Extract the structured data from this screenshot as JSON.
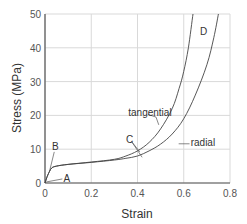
{
  "chart_data": {
    "type": "line",
    "title": "",
    "xlabel": "Strain",
    "ylabel": "Stress (MPa)",
    "xlim": [
      0,
      0.8
    ],
    "ylim": [
      0,
      50
    ],
    "xticks": [
      "0",
      "0.2",
      "0.4",
      "0.6",
      "0.8"
    ],
    "yticks": [
      "0",
      "10",
      "20",
      "30",
      "40",
      "50"
    ],
    "grid": true,
    "legend": null,
    "series": [
      {
        "name": "tangential",
        "x": [
          0,
          0.01,
          0.02,
          0.03,
          0.05,
          0.1,
          0.2,
          0.3,
          0.35,
          0.4,
          0.45,
          0.5,
          0.55,
          0.58,
          0.6,
          0.62,
          0.64
        ],
        "y": [
          0,
          2,
          3.5,
          4.5,
          5,
          5.5,
          6.2,
          7,
          8,
          9.5,
          12,
          16,
          22,
          28,
          33,
          40,
          50
        ]
      },
      {
        "name": "radial",
        "x": [
          0,
          0.01,
          0.02,
          0.03,
          0.05,
          0.1,
          0.2,
          0.3,
          0.35,
          0.4,
          0.45,
          0.5,
          0.55,
          0.6,
          0.65,
          0.7,
          0.73,
          0.75
        ],
        "y": [
          0,
          2,
          3.5,
          4.5,
          5,
          5.5,
          6.1,
          6.8,
          7.3,
          8,
          9.5,
          11.5,
          14.5,
          19,
          26,
          35,
          43,
          50
        ]
      }
    ],
    "annotations": [
      {
        "text": "A",
        "x": 0.08,
        "y": 1.5
      },
      {
        "text": "B",
        "x": 0.03,
        "y": 11
      },
      {
        "text": "C",
        "x": 0.35,
        "y": 13
      },
      {
        "text": "D",
        "x": 0.67,
        "y": 45
      },
      {
        "text": "tangential",
        "x": 0.36,
        "y": 21
      },
      {
        "text": "radial",
        "x": 0.63,
        "y": 12
      }
    ]
  }
}
